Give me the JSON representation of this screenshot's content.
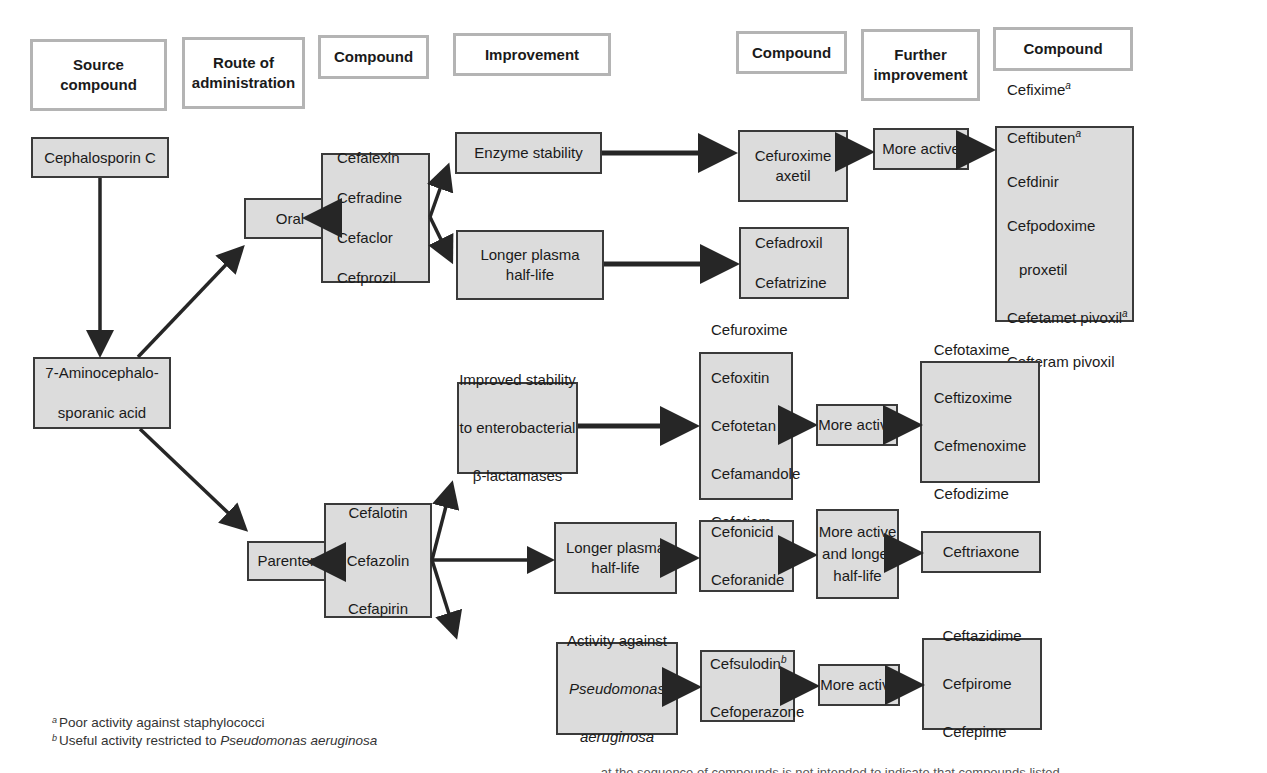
{
  "headers": [
    {
      "id": "source",
      "label": "Source\ncompound"
    },
    {
      "id": "route",
      "label": "Route of\nadministration"
    },
    {
      "id": "compound1",
      "label": "Compound"
    },
    {
      "id": "improvement",
      "label": "Improvement"
    },
    {
      "id": "compound2",
      "label": "Compound"
    },
    {
      "id": "further",
      "label": "Further\nimprovement"
    },
    {
      "id": "compound3",
      "label": "Compound"
    }
  ],
  "source": {
    "cephalosporin_c": "Cephalosporin C",
    "aca_line1": "7-Aminocephalo-",
    "aca_line2": "sporanic acid"
  },
  "routes": {
    "oral": "Oral",
    "parenteral": "Parenteral"
  },
  "oral": {
    "compounds": [
      "Cefalexin",
      "Cefradine",
      "Cefaclor",
      "Cefprozil"
    ],
    "enzyme_stability": "Enzyme stability",
    "cefuroxime_axetil": "Cefuroxime\naxetil",
    "more_active": "More active",
    "final": {
      "c1": "Cefixime",
      "c1_sup": "a",
      "c2": "Ceftibuten",
      "c2_sup": "a",
      "c3": "Cefdinir",
      "c4": "Cefpodoxime",
      "c4b": "proxetil",
      "c5": "Cefetamet pivoxil",
      "c5_sup": "a",
      "c6": "Cefteram pivoxil"
    },
    "longer_half_life": "Longer plasma\nhalf-life",
    "longer_compounds": [
      "Cefadroxil",
      "Cefatrizine"
    ]
  },
  "parenteral": {
    "compounds": [
      "Cefalotin",
      "Cefazolin",
      "Cefapirin"
    ],
    "branch1": {
      "improvement_l1": "Improved stability",
      "improvement_l2": "to enterobacterial",
      "improvement_l3": "β-lactamases",
      "compounds": [
        "Cefuroxime",
        "Cefoxitin",
        "Cefotetan",
        "Cefamandole",
        "Cefotiam"
      ],
      "further": "More active",
      "final": [
        "Cefotaxime",
        "Ceftizoxime",
        "Cefmenoxime",
        "Cefodizime"
      ]
    },
    "branch2": {
      "improvement": "Longer plasma\nhalf-life",
      "compounds": [
        "Cefonicid",
        "Ceforanide"
      ],
      "further": "More active\nand longer\nhalf-life",
      "final": "Ceftriaxone"
    },
    "branch3": {
      "improvement_l1": "Activity against",
      "improvement_l2": "Pseudomonas",
      "improvement_l3": "aeruginosa",
      "c1": "Cefsulodin",
      "c1_sup": "b",
      "c2": "Cefoperazone",
      "further": "More active",
      "final": [
        "Ceftazidime",
        "Cefpirome",
        "Cefepime"
      ]
    }
  },
  "footnotes": {
    "a_mark": "a",
    "a_text": "Poor activity against staphylococci",
    "b_mark": "b",
    "b_text_pre": "Useful activity restricted to ",
    "b_text_italic": "Pseudomonas aeruginosa"
  },
  "caption_cut": "...at the sequence of compounds is not intended to indicate that compounds listed"
}
